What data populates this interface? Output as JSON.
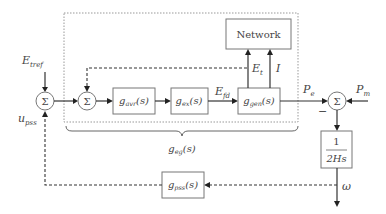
{
  "diagram": {
    "type": "block diagram",
    "summing_junction_symbol": "Σ",
    "inputs": {
      "e_tref": {
        "base": "E",
        "sub": "tref"
      },
      "u_pss": {
        "base": "u",
        "sub": "pss"
      },
      "p_m": {
        "base": "P",
        "sub": "m"
      }
    },
    "blocks": {
      "network": {
        "label": "Network"
      },
      "g_avr": {
        "base": "g",
        "sub": "avr",
        "arg": "(s)"
      },
      "g_ex": {
        "base": "g",
        "sub": "ex",
        "arg": "(s)"
      },
      "g_gen": {
        "base": "g",
        "sub": "gen",
        "arg": "(s)"
      },
      "inertia": {
        "numerator": "1",
        "denominator": "2Hs"
      },
      "g_pss": {
        "base": "g",
        "sub": "pss",
        "arg": "(s)"
      }
    },
    "signals": {
      "e_fd": {
        "base": "E",
        "sub": "fd"
      },
      "e_t": {
        "base": "E",
        "sub": "t"
      },
      "i": {
        "base": "I"
      },
      "p_e": {
        "base": "P",
        "sub": "e"
      },
      "minus_sign": "−",
      "omega": "ω"
    },
    "brace_label": {
      "base": "g",
      "sub": "eg",
      "arg": "(s)"
    }
  }
}
